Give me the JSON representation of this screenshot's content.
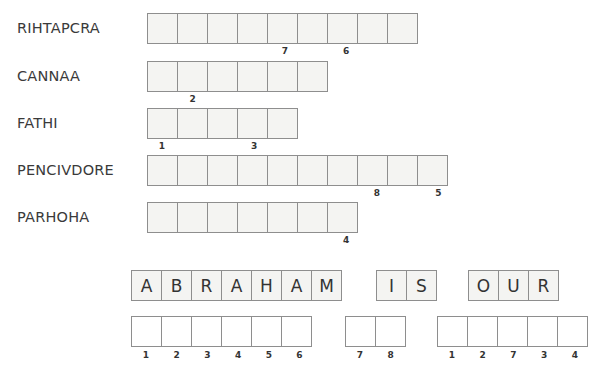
{
  "puzzle": {
    "scrambled_words": [
      {
        "label": "RIHTAPCRA",
        "length": 9,
        "clues": [
          {
            "position": 5,
            "number": "7"
          },
          {
            "position": 7,
            "number": "6"
          }
        ]
      },
      {
        "label": "CANNAA",
        "length": 6,
        "clues": [
          {
            "position": 2,
            "number": "2"
          }
        ]
      },
      {
        "label": "FATHI",
        "length": 5,
        "clues": [
          {
            "position": 1,
            "number": "1"
          },
          {
            "position": 4,
            "number": "3"
          }
        ]
      },
      {
        "label": "PENCIVDORE",
        "length": 10,
        "clues": [
          {
            "position": 8,
            "number": "8"
          },
          {
            "position": 10,
            "number": "5"
          }
        ]
      },
      {
        "label": "PARHOHA",
        "length": 7,
        "clues": [
          {
            "position": 7,
            "number": "4"
          }
        ]
      }
    ],
    "phrase_words": [
      {
        "letters": [
          "A",
          "B",
          "R",
          "A",
          "H",
          "A",
          "M"
        ]
      },
      {
        "letters": [
          "I",
          "S"
        ]
      },
      {
        "letters": [
          "O",
          "U",
          "R"
        ]
      }
    ],
    "answer_groups": [
      {
        "numbers": [
          "1",
          "2",
          "3",
          "4",
          "5",
          "6"
        ]
      },
      {
        "numbers": [
          "7",
          "8"
        ]
      },
      {
        "numbers": [
          "1",
          "2",
          "7",
          "3",
          "4"
        ]
      }
    ]
  }
}
